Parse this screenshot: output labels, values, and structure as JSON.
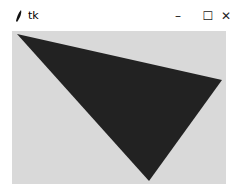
{
  "window": {
    "title": "tk",
    "icon": "feather-icon",
    "controls": {
      "minimize": "–",
      "maximize": "☐",
      "close": "✕"
    }
  },
  "canvas": {
    "background": "#d9d9d9",
    "shapes": [
      {
        "type": "polygon",
        "fill": "#222222",
        "points": [
          [
            5,
            3
          ],
          [
            210,
            49
          ],
          [
            137,
            150
          ]
        ]
      }
    ]
  }
}
